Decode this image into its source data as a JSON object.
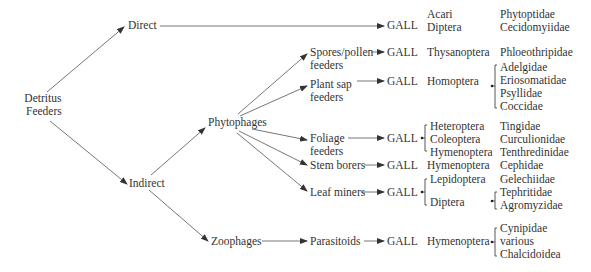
{
  "root": {
    "line1": "Detritus",
    "line2": "Feeders"
  },
  "level1": {
    "direct": "Direct",
    "indirect": "Indirect"
  },
  "level2": {
    "phytophages": "Phytophages",
    "zoophages": "Zoophages"
  },
  "level3": {
    "spores": {
      "line1": "Spores/pollen",
      "line2": "feeders"
    },
    "plantsap": {
      "line1": "Plant sap",
      "line2": "feeders"
    },
    "foliage": {
      "line1": "Foliage",
      "line2": "feeders"
    },
    "stem": "Stem borers",
    "leaf": "Leaf miners",
    "parasitoids": "Parasitoids"
  },
  "gall_label": "GALL",
  "rows": {
    "direct": {
      "orders": [
        "Acari",
        "Diptera"
      ],
      "families": [
        "Phytoptidae",
        "Cecidomyiidae"
      ]
    },
    "spores": {
      "orders": [
        "Thysanoptera"
      ],
      "families": [
        "Phloeothripidae"
      ]
    },
    "plantsap": {
      "orders": [
        "Homoptera"
      ],
      "families": [
        "Adelgidae",
        "Eriosomatidae",
        "Psyllidae",
        "Coccidae"
      ]
    },
    "foliage": {
      "orders": [
        "Heteroptera",
        "Coleoptera",
        "Hymenoptera"
      ],
      "families": [
        "Tingidae",
        "Curculionidae",
        "Tenthredinidae"
      ]
    },
    "stem": {
      "orders": [
        "Hymenoptera"
      ],
      "families": [
        "Cephidae"
      ]
    },
    "leaf": {
      "orders": [
        "Lepidoptera",
        "Diptera"
      ],
      "families": [
        "Gelechiidae",
        "Tephritidae",
        "Agromyzidae"
      ]
    },
    "parasitoids": {
      "orders": [
        "Hymenoptera"
      ],
      "families": [
        "Cynipidae",
        "various",
        "Chalcidoidea"
      ]
    }
  },
  "colors": {
    "line": "#555555",
    "text": "#333333"
  }
}
